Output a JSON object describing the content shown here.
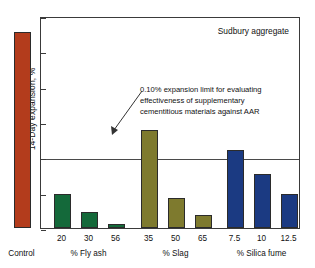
{
  "chart_data": {
    "type": "bar",
    "title": "",
    "annotation_corner": "Sudbury aggregate",
    "xlabel": "",
    "ylabel": "14-Day expansion, %",
    "ylim": [
      0,
      0.3
    ],
    "yticks": [
      0,
      0.05,
      0.1,
      0.15,
      0.2,
      0.25,
      0.3
    ],
    "ytick_labels": [
      "0",
      "0.05",
      "0.1",
      "0.15",
      "0.2",
      "0.25",
      "0.3"
    ],
    "grid": false,
    "legend": "none",
    "limit_line": {
      "value": 0.1,
      "label": "0.10% expansion limit for evaluating\neffectiveness of supplementary\ncementitious materials against AAR"
    },
    "categories": [
      "Control",
      "20",
      "30",
      "56",
      "35",
      "50",
      "65",
      "7.5",
      "10",
      "12.5"
    ],
    "values": [
      0.278,
      0.048,
      0.022,
      0.005,
      0.139,
      0.042,
      0.018,
      0.11,
      0.076,
      0.048
    ],
    "groups": [
      {
        "label": "Control",
        "members": [
          "Control"
        ],
        "color": "#b33c1c"
      },
      {
        "label": "% Fly ash",
        "members": [
          "20",
          "30",
          "56"
        ],
        "color": "#14693a"
      },
      {
        "label": "% Slag",
        "members": [
          "35",
          "50",
          "65"
        ],
        "color": "#7e7a2e"
      },
      {
        "label": "% Silica fume",
        "members": [
          "7.5",
          "10",
          "12.5"
        ],
        "color": "#1b3a82"
      }
    ],
    "bars": [
      {
        "category": "Control",
        "value": 0.278,
        "group": "Control",
        "color": "#b33c1c"
      },
      {
        "category": "20",
        "value": 0.048,
        "group": "% Fly ash",
        "color": "#14693a"
      },
      {
        "category": "30",
        "value": 0.022,
        "group": "% Fly ash",
        "color": "#14693a"
      },
      {
        "category": "56",
        "value": 0.005,
        "group": "% Fly ash",
        "color": "#14693a"
      },
      {
        "category": "35",
        "value": 0.139,
        "group": "% Slag",
        "color": "#7e7a2e"
      },
      {
        "category": "50",
        "value": 0.042,
        "group": "% Slag",
        "color": "#7e7a2e"
      },
      {
        "category": "65",
        "value": 0.018,
        "group": "% Slag",
        "color": "#7e7a2e"
      },
      {
        "category": "7.5",
        "value": 0.11,
        "group": "% Silica fume",
        "color": "#1b3a82"
      },
      {
        "category": "10",
        "value": 0.076,
        "group": "% Silica fume",
        "color": "#1b3a82"
      },
      {
        "category": "12.5",
        "value": 0.048,
        "group": "% Silica fume",
        "color": "#1b3a82"
      }
    ]
  }
}
